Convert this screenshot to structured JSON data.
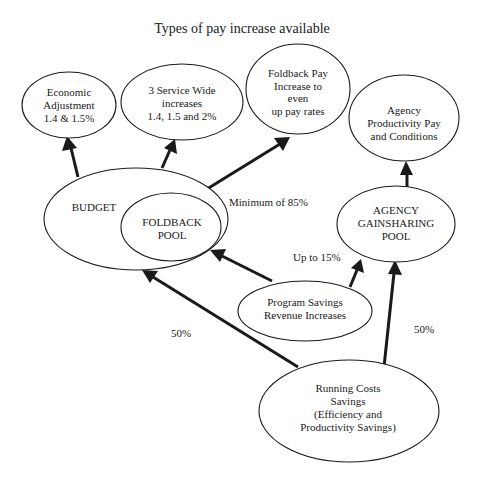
{
  "title": "Types of pay increase available",
  "nodes": {
    "economic_adjustment": {
      "lines": [
        "Economic",
        "Adjustment",
        "1.4 & 1.5%"
      ]
    },
    "service_wide": {
      "lines": [
        "3 Service Wide",
        "increases",
        "1.4, 1.5 and 2%"
      ]
    },
    "foldback_pay": {
      "lines": [
        "Foldback Pay",
        "Increase to",
        "even",
        "up pay rates"
      ]
    },
    "agency_productivity": {
      "lines": [
        "Agency",
        "Productivity Pay",
        "and Conditions"
      ]
    },
    "budget": {
      "lines": [
        "BUDGET"
      ]
    },
    "foldback_pool": {
      "lines": [
        "FOLDBACK",
        "POOL"
      ]
    },
    "agency_gainsharing": {
      "lines": [
        "AGENCY",
        "GAINSHARING",
        "POOL"
      ]
    },
    "program_savings": {
      "lines": [
        "Program Savings",
        "Revenue Increases"
      ]
    },
    "running_costs": {
      "lines": [
        "Running Costs",
        "Savings",
        "(Efficiency and",
        "Productivity Savings)"
      ]
    }
  },
  "edge_labels": {
    "minimum_85": "Minimum of 85%",
    "up_to_15": "Up to 15%",
    "left_50": "50%",
    "right_50": "50%"
  },
  "edges": [
    {
      "from": "budget",
      "to": "economic_adjustment"
    },
    {
      "from": "budget",
      "to": "service_wide"
    },
    {
      "from": "budget",
      "to": "foldback_pay"
    },
    {
      "from": "agency_gainsharing",
      "to": "agency_productivity"
    },
    {
      "from": "program_savings",
      "to": "foldback_pool"
    },
    {
      "from": "program_savings",
      "to": "agency_gainsharing"
    },
    {
      "from": "running_costs",
      "to": "budget"
    },
    {
      "from": "running_costs",
      "to": "agency_gainsharing"
    }
  ],
  "colors": {
    "stroke": "#1a1a1a",
    "background": "#ffffff"
  }
}
